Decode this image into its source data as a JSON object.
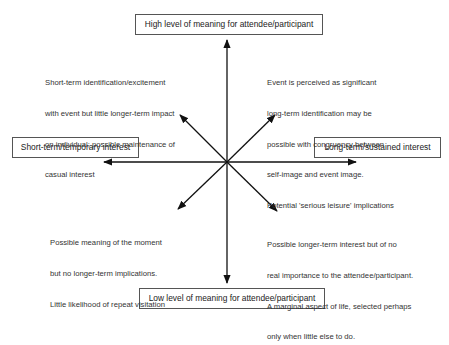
{
  "diagram": {
    "axes": {
      "vertical": {
        "top_label": "High level of meaning for attendee/participant",
        "bottom_label": "Low level  of meaning for attendee/participant"
      },
      "horizontal": {
        "left_label": "Short-term/temporary interest",
        "right_label": "Long-term/sustained interest"
      }
    },
    "quadrants": {
      "top_left": {
        "lines": [
          "Short-term identification/excitement",
          "with event but little longer-term impact",
          "on individual; possible maintenance of",
          "casual interest"
        ]
      },
      "top_right": {
        "lines": [
          "Event is perceived as significant",
          "long-term identification may be",
          "possible with congruency between",
          "self-image and event image.",
          "Potential 'serious leisure' implications"
        ]
      },
      "bottom_left": {
        "lines": [
          "Possible meaning of the moment",
          "but no longer-term implications.",
          "Little likelihood of repeat visitation"
        ]
      },
      "bottom_right": {
        "lines": [
          "Possible longer-term interest but of no",
          "real importance to the attendee/participant.",
          "A marginal aspect of life, selected perhaps",
          "only when little else to do."
        ]
      }
    },
    "colors": {
      "line": "#111111",
      "box_border": "#555555",
      "text": "#333333"
    }
  }
}
